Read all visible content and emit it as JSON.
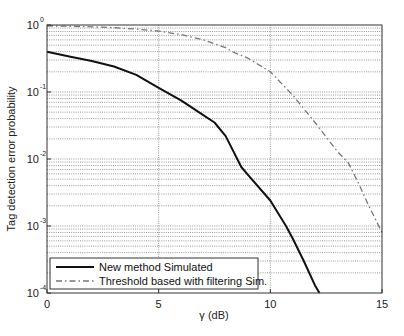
{
  "chart_data": {
    "type": "line",
    "title": "",
    "xlabel": "γ (dB)",
    "ylabel": "Tag detection error probability",
    "xscale": "linear",
    "yscale": "log",
    "xlim": [
      0,
      15
    ],
    "ylim": [
      0.0001,
      1
    ],
    "xticks": [
      0,
      5,
      10,
      15
    ],
    "xtick_labels": [
      "0",
      "5",
      "10",
      "15"
    ],
    "yticks": [
      1,
      0.1,
      0.01,
      0.001,
      0.0001
    ],
    "ytick_labels": [
      {
        "base": "10",
        "exp": "0"
      },
      {
        "base": "10",
        "exp": "-1"
      },
      {
        "base": "10",
        "exp": "-2"
      },
      {
        "base": "10",
        "exp": "-3"
      },
      {
        "base": "10",
        "exp": "-4"
      }
    ],
    "grid": {
      "x": "major",
      "y": "major+minor",
      "style": "dotted"
    },
    "legend_position": "lower left",
    "series": [
      {
        "name": "New method Simulated",
        "style": "solid",
        "color": "#111111",
        "x": [
          0,
          1,
          2,
          3,
          4,
          5,
          6,
          7,
          7.5,
          8,
          8.7,
          9,
          10,
          10.7,
          11,
          11.5,
          12,
          12.2
        ],
        "y": [
          0.4,
          0.34,
          0.29,
          0.24,
          0.18,
          0.115,
          0.075,
          0.045,
          0.035,
          0.022,
          0.0076,
          0.0058,
          0.0024,
          0.001,
          0.00065,
          0.0003,
          0.00013,
          0.0001
        ]
      },
      {
        "name": "Threshold based with filtering Sim.",
        "style": "dash-dot",
        "color": "#777777",
        "x": [
          0,
          1,
          2,
          3,
          4,
          5,
          6,
          7,
          8,
          8.3,
          9,
          10,
          11,
          12,
          13,
          13.5,
          14,
          14.35,
          15
        ],
        "y": [
          0.97,
          0.96,
          0.94,
          0.91,
          0.87,
          0.81,
          0.72,
          0.6,
          0.46,
          0.4,
          0.32,
          0.2,
          0.09,
          0.035,
          0.013,
          0.0087,
          0.004,
          0.0022,
          0.0008
        ]
      }
    ]
  },
  "legend": {
    "items": [
      {
        "label": "New method Simulated"
      },
      {
        "label": "Threshold based with filtering Sim."
      }
    ]
  },
  "axes": {
    "xlabel": "γ (dB)",
    "ylabel": "Tag detection error probability"
  }
}
